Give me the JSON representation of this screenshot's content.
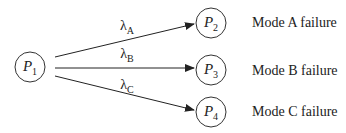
{
  "nodes": [
    {
      "id": "P1",
      "base": "P",
      "sub": "1"
    },
    {
      "id": "P2",
      "base": "P",
      "sub": "2"
    },
    {
      "id": "P3",
      "base": "P",
      "sub": "3"
    },
    {
      "id": "P4",
      "base": "P",
      "sub": "4"
    }
  ],
  "rates": [
    {
      "base": "λ",
      "sub": "A"
    },
    {
      "base": "λ",
      "sub": "B"
    },
    {
      "base": "λ",
      "sub": "C"
    }
  ],
  "modes": [
    "Mode A failure",
    "Mode B failure",
    "Mode C failure"
  ]
}
